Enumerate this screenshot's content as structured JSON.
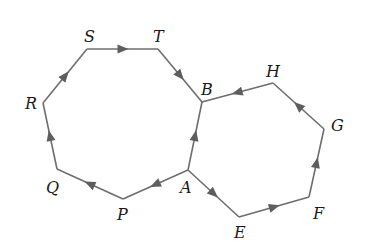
{
  "diagram": {
    "stroke_color": "#6e6e6e",
    "arrow_color": "#5e5e5e",
    "vertices": {
      "A": {
        "x": 188,
        "y": 170,
        "label": "A",
        "lx": 180,
        "ly": 193
      },
      "B": {
        "x": 202,
        "y": 102,
        "label": "B",
        "lx": 201,
        "ly": 95
      },
      "P": {
        "x": 123,
        "y": 199,
        "label": "P",
        "lx": 117,
        "ly": 220
      },
      "Q": {
        "x": 57,
        "y": 169,
        "label": "Q",
        "lx": 46,
        "ly": 193
      },
      "R": {
        "x": 43,
        "y": 103,
        "label": "R",
        "lx": 25,
        "ly": 109
      },
      "S": {
        "x": 87,
        "y": 49,
        "label": "S",
        "lx": 84,
        "ly": 42
      },
      "T": {
        "x": 158,
        "y": 49,
        "label": "T",
        "lx": 153,
        "ly": 42
      },
      "H": {
        "x": 273,
        "y": 83,
        "label": "H",
        "lx": 266,
        "ly": 77
      },
      "G": {
        "x": 324,
        "y": 129,
        "label": "G",
        "lx": 331,
        "ly": 131
      },
      "F": {
        "x": 309,
        "y": 197,
        "label": "F",
        "lx": 313,
        "ly": 219
      },
      "E": {
        "x": 239,
        "y": 217,
        "label": "E",
        "lx": 234,
        "ly": 238
      }
    },
    "edges": [
      {
        "from": "A",
        "to": "P",
        "arrow": true
      },
      {
        "from": "P",
        "to": "Q",
        "arrow": true
      },
      {
        "from": "Q",
        "to": "R",
        "arrow": true
      },
      {
        "from": "R",
        "to": "S",
        "arrow": true
      },
      {
        "from": "S",
        "to": "T",
        "arrow": true
      },
      {
        "from": "T",
        "to": "B",
        "arrow": true
      },
      {
        "from": "A",
        "to": "B",
        "arrow": true
      },
      {
        "from": "A",
        "to": "E",
        "arrow": true
      },
      {
        "from": "E",
        "to": "F",
        "arrow": true
      },
      {
        "from": "F",
        "to": "G",
        "arrow": true
      },
      {
        "from": "G",
        "to": "H",
        "arrow": true
      },
      {
        "from": "H",
        "to": "B",
        "arrow": true
      }
    ]
  }
}
